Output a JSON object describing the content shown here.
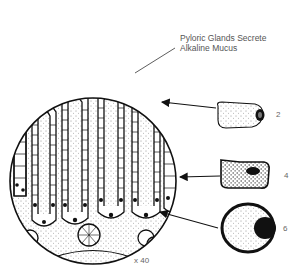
{
  "title": {
    "line1": "Pyloric Glands Secrete",
    "line2": "Alkaline Mucus"
  },
  "magnification": "x 40",
  "cell_labels": [
    {
      "id": "cell-2",
      "label": "2"
    },
    {
      "id": "cell-4",
      "label": "4"
    },
    {
      "id": "cell-6",
      "label": "6"
    }
  ],
  "colors": {
    "ink": "#111111",
    "text": "#555555",
    "background": "#ffffff"
  }
}
